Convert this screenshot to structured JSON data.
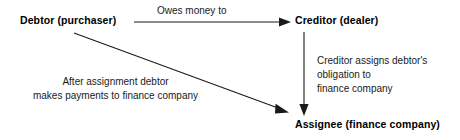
{
  "diagram": {
    "background_color": "#ffffff",
    "line_color": "#1a1a1a",
    "text_color": "#000000",
    "nodes": [
      {
        "id": "debtor",
        "label": "Debtor (purchaser)"
      },
      {
        "id": "creditor",
        "label": "Creditor (dealer)"
      },
      {
        "id": "assignee",
        "label": "Assignee (finance company)"
      }
    ],
    "edges": [
      {
        "id": "debtor-to-creditor",
        "from": "debtor",
        "to": "creditor",
        "label": "Owes money to",
        "direction": "horizontal-right"
      },
      {
        "id": "creditor-to-assignee",
        "from": "creditor",
        "to": "assignee",
        "label_line1": "Creditor assigns debtor's",
        "label_line2": "obligation to",
        "label_line3": "finance company",
        "direction": "vertical-down"
      },
      {
        "id": "debtor-to-assignee",
        "from": "debtor",
        "to": "assignee",
        "label_line1": "After assignment debtor",
        "label_line2": "makes payments to finance company",
        "direction": "diagonal-down-right"
      }
    ]
  }
}
